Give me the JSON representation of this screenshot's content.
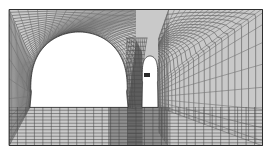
{
  "figure": {
    "type": "fem-mesh-diagram"
  },
  "colors": {
    "background": "#ffffff",
    "rock_fill": "#c9c9c9",
    "rock_fill_dark": "#8e8e8e",
    "pillar_fill": "#6f6f6f",
    "cavity_fill": "#ffffff",
    "mesh_line": "#4a4a4a",
    "mesh_line_light": "#6d6d6d",
    "boundary_line": "#2e2e2e",
    "marker": "#2a2a2a"
  },
  "domain": {
    "left": 9,
    "top": 9,
    "right": 263,
    "bottom": 146,
    "label": "rock-mass-domain"
  },
  "regions": [
    {
      "name": "main-cavern",
      "label": "Main cavern (large arch)",
      "shape": "arched-opening",
      "x_left": 30,
      "x_right": 128,
      "y_crown": 32,
      "y_floor": 107
    },
    {
      "name": "side-gallery",
      "label": "Side gallery (pointed arch)",
      "shape": "ogive-opening",
      "x_left": 142,
      "x_right": 158,
      "y_crown": 56,
      "y_floor": 107
    },
    {
      "name": "central-pillar",
      "label": "Central rock pillar",
      "x_left": 128,
      "x_right": 142,
      "y_top": 40,
      "y_bottom": 107
    },
    {
      "name": "floor-material-zone",
      "label": "Lower material zone",
      "x_left": 108,
      "x_right": 168,
      "y_top": 107,
      "y_bottom": 146
    }
  ],
  "markers": [
    {
      "name": "gallery-marker",
      "label": "▪",
      "x": 147,
      "y": 75,
      "width": 6,
      "height": 4
    }
  ],
  "mesh": {
    "radial_divisions": 26,
    "circumferential_divisions": 46,
    "line_width": 0.55,
    "grading": "fine-near-opening"
  },
  "caption": ""
}
